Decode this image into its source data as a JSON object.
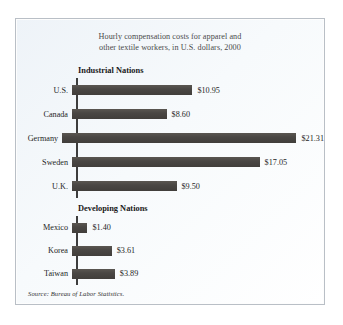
{
  "figure": {
    "title_line1": "Hourly compensation costs for apparel and",
    "title_line2": "other textile workers, in U.S. dollars, 2000",
    "source": "Source: Bureau of Labor Statistics.",
    "section_industrial_label": "Industrial Nations",
    "section_developing_label": "Developing Nations",
    "bar_color": "#4a4744",
    "frame_color": "#b9bfc6",
    "background_color": "#f4f7fa"
  },
  "chart_data": {
    "type": "bar",
    "orientation": "horizontal",
    "title": "Hourly compensation costs for apparel and other textile workers, in U.S. dollars, 2000",
    "xlabel": "",
    "ylabel": "",
    "unit": "U.S. dollars per hour",
    "year": 2000,
    "grid": false,
    "legend": "none",
    "xlim": [
      0,
      21.31
    ],
    "groups": [
      {
        "name": "Industrial Nations",
        "categories": [
          "U.S.",
          "Canada",
          "Germany",
          "Sweden",
          "U.K."
        ],
        "values": [
          10.95,
          8.6,
          21.31,
          17.05,
          9.5
        ],
        "labels": [
          "$10.95",
          "$8.60",
          "$21.31",
          "$17.05",
          "$9.50"
        ]
      },
      {
        "name": "Developing Nations",
        "categories": [
          "Mexico",
          "Korea",
          "Taiwan"
        ],
        "values": [
          1.4,
          3.61,
          3.89
        ],
        "labels": [
          "$1.40",
          "$3.61",
          "$3.89"
        ]
      }
    ],
    "source": "Source: Bureau of Labor Statistics."
  }
}
